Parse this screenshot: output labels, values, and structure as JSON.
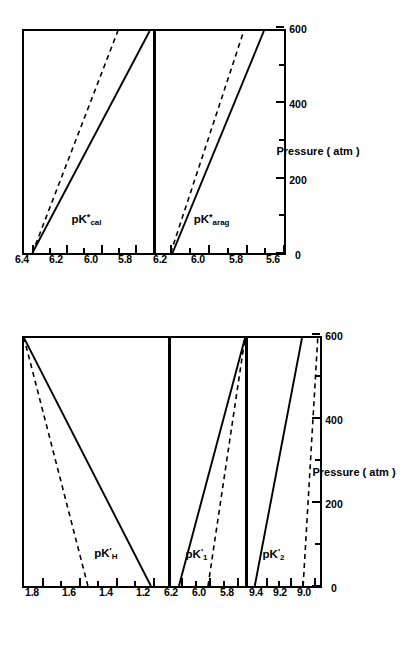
{
  "figure": {
    "orientation": "rotated-90-ccw",
    "xaxis": {
      "title": "Pressure ( atm )",
      "ticks": [
        "0",
        "200",
        "400",
        "600"
      ],
      "min": 0,
      "max": 600,
      "minor_step": 100
    },
    "linestyles": {
      "solid_label": "solid",
      "dashed_label": "dashed"
    },
    "colors": {
      "ink": "#000000",
      "background": "#ffffff"
    }
  },
  "chart_data": [
    {
      "type": "line",
      "title": "",
      "panel_id": "pKH",
      "group": "left",
      "ylabel": "pK'H",
      "ylabel_base": "pK",
      "ylabel_sub": "H",
      "ylabel_sup": "'",
      "xlabel": "Pressure ( atm )",
      "x": [
        0,
        600
      ],
      "xlim": [
        0,
        600
      ],
      "ylim": [
        1.1,
        1.9
      ],
      "yticks": [
        "1.8",
        "1.6",
        "1.4",
        "1.2"
      ],
      "ytick_values": [
        1.8,
        1.6,
        1.4,
        1.2
      ],
      "grid": false,
      "legend": "none",
      "series": [
        {
          "name": "solid",
          "style": "solid",
          "values": [
            1.195,
            1.9
          ]
        },
        {
          "name": "dashed",
          "style": "dashed",
          "values": [
            1.545,
            1.9
          ]
        }
      ]
    },
    {
      "type": "line",
      "panel_id": "pK1",
      "group": "left",
      "ylabel": "pK'1",
      "ylabel_base": "pK",
      "ylabel_sub": "1",
      "ylabel_sup": "'",
      "xlabel": "Pressure ( atm )",
      "x": [
        0,
        600
      ],
      "xlim": [
        0,
        600
      ],
      "ylim": [
        5.72,
        6.28
      ],
      "yticks": [
        "6.2",
        "6.0",
        "5.8"
      ],
      "ytick_values": [
        6.2,
        6.0,
        5.8
      ],
      "grid": false,
      "legend": "none",
      "series": [
        {
          "name": "solid",
          "style": "solid",
          "values": [
            6.22,
            5.72
          ]
        },
        {
          "name": "dashed",
          "style": "dashed",
          "values": [
            6.0,
            5.72
          ]
        }
      ]
    },
    {
      "type": "line",
      "panel_id": "pK2",
      "group": "left",
      "ylabel": "pK'2",
      "ylabel_base": "pK",
      "ylabel_sub": "2",
      "ylabel_sup": "'",
      "xlabel": "Pressure ( atm )",
      "x": [
        0,
        600
      ],
      "xlim": [
        0,
        600
      ],
      "ylim": [
        8.92,
        9.56
      ],
      "yticks": [
        "9.4",
        "9.2",
        "9.0"
      ],
      "ytick_values": [
        9.4,
        9.2,
        9.0
      ],
      "grid": false,
      "legend": "none",
      "series": [
        {
          "name": "solid",
          "style": "solid",
          "values": [
            9.5,
            9.08
          ]
        },
        {
          "name": "dashed",
          "style": "dashed",
          "values": [
            9.07,
            8.94
          ]
        }
      ]
    },
    {
      "type": "line",
      "panel_id": "pKcal",
      "group": "right",
      "ylabel": "pK*cal",
      "ylabel_base": "pK",
      "ylabel_sub": "cal",
      "ylabel_sup": "*",
      "xlabel": "Pressure ( atm )",
      "x": [
        0,
        600
      ],
      "xlim": [
        0,
        600
      ],
      "ylim": [
        5.68,
        6.45
      ],
      "yticks": [
        "6.4",
        "6.2",
        "6.0",
        "5.8"
      ],
      "ytick_values": [
        6.4,
        6.2,
        6.0,
        5.8
      ],
      "grid": false,
      "legend": "none",
      "series": [
        {
          "name": "solid",
          "style": "solid",
          "values": [
            6.4,
            5.7
          ]
        },
        {
          "name": "dashed",
          "style": "dashed",
          "values": [
            6.4,
            5.89
          ]
        }
      ]
    },
    {
      "type": "line",
      "panel_id": "pKarag",
      "group": "right",
      "ylabel": "pK*arag",
      "ylabel_base": "pK",
      "ylabel_sub": "arag",
      "ylabel_sup": "*",
      "xlabel": "Pressure ( atm )",
      "x": [
        0,
        600
      ],
      "xlim": [
        0,
        600
      ],
      "ylim": [
        5.58,
        6.28
      ],
      "yticks": [
        "6.2",
        "6.0",
        "5.8",
        "5.6"
      ],
      "ytick_values": [
        6.2,
        6.0,
        5.8,
        5.6
      ],
      "grid": false,
      "legend": "none",
      "series": [
        {
          "name": "solid",
          "style": "solid",
          "values": [
            6.19,
            5.69
          ]
        },
        {
          "name": "dashed",
          "style": "dashed",
          "values": [
            6.2,
            5.8
          ]
        }
      ]
    }
  ]
}
